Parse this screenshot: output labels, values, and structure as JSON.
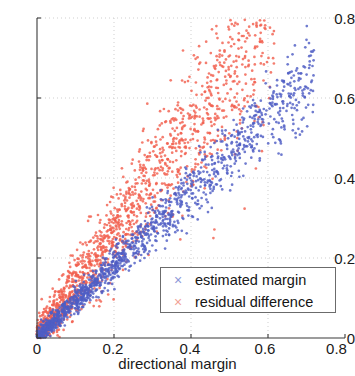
{
  "chart_data": {
    "type": "scatter",
    "title": "",
    "xlabel": "directional margin",
    "ylabel": "",
    "xlim": [
      0,
      0.8
    ],
    "ylim": [
      0,
      0.8
    ],
    "xticks": [
      "0",
      "0.2",
      "0.4",
      "0.6",
      "0.8"
    ],
    "xtick_values": [
      0,
      0.2,
      0.4,
      0.6,
      0.8
    ],
    "yticks": [
      "0",
      "0.2",
      "0.4",
      "0.6",
      "0.8"
    ],
    "ytick_values": [
      0,
      0.2,
      0.4,
      0.6,
      0.8
    ],
    "grid": true,
    "grid_style": "dotted",
    "grid_color": "#cfcfcf",
    "legend_position": "lower right",
    "marker": "x",
    "series": [
      {
        "name": "estimated margin",
        "color": "#4f5ec4",
        "marker": "x",
        "description": "Blue band lying just below the y=x diagonal, tight linear cluster from origin fanning out toward (0.55, 0.5)",
        "slope": 0.92,
        "intercept": 0.0,
        "spread": 0.045,
        "n_points": 1450,
        "x_max": 0.72
      },
      {
        "name": "residual difference",
        "color": "#f2604f",
        "marker": "x",
        "description": "Red band above the blue band, wider fan spreading from origin upward to about (0.45, 0.65)",
        "slope": 1.3,
        "intercept": 0.0,
        "spread": 0.1,
        "n_points": 1600,
        "x_max": 0.62
      }
    ]
  },
  "axes": {
    "x_tick_labels": [
      "0",
      "0.2",
      "0.4",
      "0.6",
      "0.8"
    ],
    "y_tick_labels": [
      "0",
      "0.2",
      "0.4",
      "0.6",
      "0.8"
    ],
    "x_axis_label": "directional margin"
  },
  "legend": {
    "entries": [
      {
        "marker": "×",
        "label": "estimated margin",
        "color": "#4f5ec4"
      },
      {
        "marker": "×",
        "label": "residual difference",
        "color": "#f2604f"
      }
    ]
  }
}
